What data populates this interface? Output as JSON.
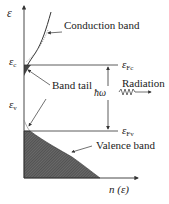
{
  "diagram": {
    "axis": {
      "y_label": "ε",
      "x_label": "n (ε)"
    },
    "levels": {
      "conduction_edge": {
        "symbol": "ε",
        "subscript": "c"
      },
      "valence_edge": {
        "symbol": "ε",
        "subscript": "v"
      },
      "quasi_fermi_conduction": {
        "symbol": "ε",
        "subscript": "Fc"
      },
      "quasi_fermi_valence": {
        "symbol": "ε",
        "subscript": "Fv"
      }
    },
    "annotations": {
      "conduction_band": "Conduction band",
      "band_tail": "Band tail",
      "radiation": "Radiation",
      "photon_energy": "ħω",
      "valence_band": "Valence band"
    },
    "colors": {
      "line": "#333333",
      "shading": "#555555",
      "dotted": "#888888"
    }
  }
}
